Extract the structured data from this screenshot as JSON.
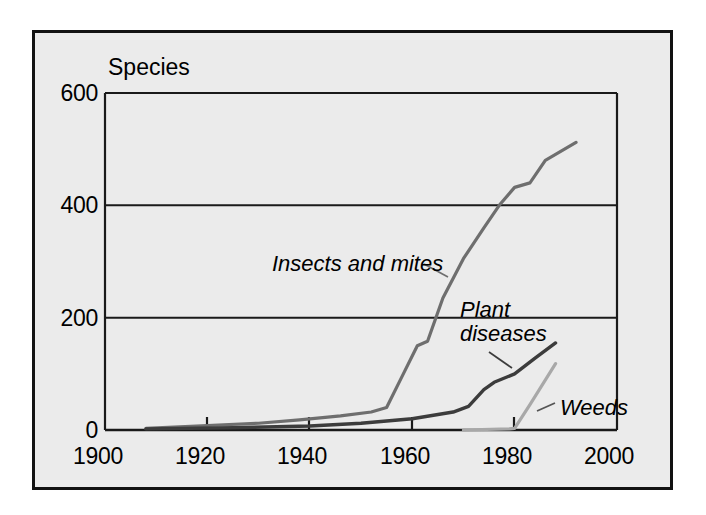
{
  "figure": {
    "background_color": "#ffffff",
    "panel_color": "#ebebeb",
    "border_color": "#121212"
  },
  "chart_data": {
    "type": "line",
    "title": "",
    "subtitle": "",
    "axis_title": "Species",
    "xlabel": "",
    "ylabel": "Species",
    "xlim": [
      1900,
      2000
    ],
    "ylim": [
      0,
      600
    ],
    "xticks": [
      1900,
      1920,
      1940,
      1960,
      1980,
      2000
    ],
    "xtick_labels": [
      "1900",
      "1920",
      "1940",
      "1960",
      "1980",
      "2000"
    ],
    "yticks": [
      0,
      200,
      400,
      600
    ],
    "ytick_labels": [
      "0",
      "200",
      "400",
      "600"
    ],
    "grid": "horizontal",
    "legend_position": "inline-annotations",
    "series": [
      {
        "name": "Insects and mites",
        "color": "#6e6e6e",
        "label_text": "Insects and mites",
        "points": [
          [
            1908,
            3
          ],
          [
            1920,
            8
          ],
          [
            1930,
            12
          ],
          [
            1938,
            18
          ],
          [
            1946,
            25
          ],
          [
            1952,
            32
          ],
          [
            1955,
            40
          ],
          [
            1958,
            95
          ],
          [
            1961,
            150
          ],
          [
            1963,
            158
          ],
          [
            1966,
            235
          ],
          [
            1970,
            305
          ],
          [
            1974,
            360
          ],
          [
            1977,
            400
          ],
          [
            1980,
            432
          ],
          [
            1983,
            440
          ],
          [
            1986,
            480
          ],
          [
            1992,
            512
          ]
        ]
      },
      {
        "name": "Plant diseases",
        "color": "#3c3c3c",
        "label_text": "Plant\ndiseases",
        "points": [
          [
            1908,
            2
          ],
          [
            1925,
            4
          ],
          [
            1940,
            7
          ],
          [
            1950,
            12
          ],
          [
            1960,
            20
          ],
          [
            1968,
            32
          ],
          [
            1971,
            42
          ],
          [
            1974,
            72
          ],
          [
            1976,
            85
          ],
          [
            1980,
            100
          ],
          [
            1984,
            128
          ],
          [
            1988,
            155
          ]
        ]
      },
      {
        "name": "Weeds",
        "color": "#a8a8a8",
        "label_text": "Weeds",
        "points": [
          [
            1970,
            0
          ],
          [
            1979,
            2
          ],
          [
            1980,
            3
          ],
          [
            1983,
            45
          ],
          [
            1988,
            118
          ]
        ]
      }
    ]
  },
  "labels": {
    "axis_title": "Species",
    "insects": "Insects and mites",
    "plant_line1": "Plant",
    "plant_line2": "diseases",
    "weeds": "Weeds",
    "y_0": "0",
    "y_200": "200",
    "y_400": "400",
    "y_600": "600",
    "x_1900": "1900",
    "x_1920": "1920",
    "x_1940": "1940",
    "x_1960": "1960",
    "x_1980": "1980",
    "x_2000": "2000"
  }
}
